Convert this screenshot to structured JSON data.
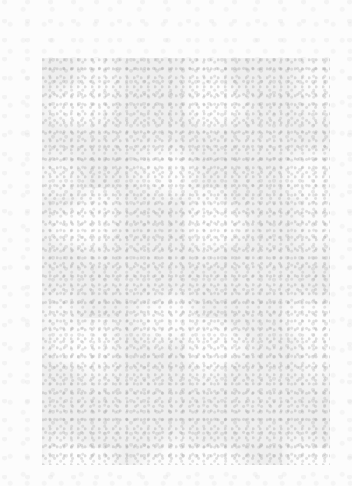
{
  "image": {
    "description": "Light gray mottled noise texture on a near-white background; no legible text or UI elements",
    "background_color": "#fbfbfb",
    "regions": [
      {
        "name": "textured-panel",
        "color": "#eeeeee",
        "bounds": {
          "x": 42,
          "y": 58,
          "width": 288,
          "height": 407
        }
      }
    ]
  }
}
